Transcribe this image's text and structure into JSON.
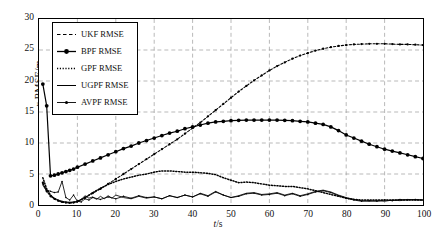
{
  "chart_data": {
    "type": "line",
    "title": "",
    "xlabel": "t/s",
    "ylabel": "x RMSE/m",
    "xlim": [
      0,
      100
    ],
    "ylim": [
      0,
      30
    ],
    "xticks": [
      0,
      10,
      20,
      30,
      40,
      50,
      60,
      70,
      80,
      90,
      100
    ],
    "yticks": [
      0,
      5,
      10,
      15,
      20,
      25,
      30
    ],
    "grid": true,
    "legend_position": "upper-left-inset",
    "series": [
      {
        "name": "UKF RMSE",
        "style": "dashed",
        "marker": "dot-dense",
        "x": [
          1,
          2,
          3,
          4,
          5,
          6,
          7,
          8,
          9,
          10,
          12,
          14,
          16,
          18,
          20,
          22,
          24,
          26,
          28,
          30,
          32,
          34,
          36,
          38,
          40,
          42,
          44,
          46,
          48,
          50,
          52,
          54,
          56,
          58,
          60,
          62,
          64,
          66,
          68,
          70,
          72,
          74,
          76,
          78,
          80,
          82,
          84,
          86,
          88,
          90,
          92,
          94,
          96,
          98,
          100
        ],
        "values": [
          3.6,
          2.2,
          1.4,
          1.0,
          0.7,
          0.5,
          0.4,
          0.35,
          0.4,
          0.6,
          1.2,
          1.9,
          2.6,
          3.4,
          4.2,
          5.0,
          5.8,
          6.6,
          7.4,
          8.2,
          9.0,
          9.8,
          10.6,
          11.5,
          12.4,
          13.3,
          14.3,
          15.3,
          16.3,
          17.3,
          18.3,
          19.2,
          20.1,
          20.9,
          21.7,
          22.4,
          23.0,
          23.6,
          24.1,
          24.5,
          24.9,
          25.2,
          25.45,
          25.65,
          25.8,
          25.9,
          25.95,
          26.0,
          26.0,
          26.0,
          25.95,
          25.9,
          25.9,
          25.85,
          25.8
        ]
      },
      {
        "name": "BPF RMSE",
        "style": "solid",
        "marker": "circle-filled",
        "x": [
          1,
          2,
          3,
          4,
          5,
          6,
          7,
          8,
          9,
          10,
          12,
          14,
          16,
          18,
          20,
          22,
          24,
          26,
          28,
          30,
          32,
          34,
          36,
          38,
          40,
          42,
          44,
          46,
          48,
          50,
          52,
          54,
          56,
          58,
          60,
          62,
          64,
          66,
          68,
          70,
          72,
          74,
          76,
          78,
          80,
          82,
          84,
          86,
          88,
          90,
          92,
          94,
          96,
          98,
          100
        ],
        "values": [
          19.5,
          16.0,
          4.7,
          4.8,
          5.0,
          5.2,
          5.4,
          5.6,
          5.8,
          6.1,
          6.6,
          7.1,
          7.6,
          8.1,
          8.6,
          9.1,
          9.5,
          10.0,
          10.4,
          10.8,
          11.2,
          11.6,
          11.9,
          12.3,
          12.6,
          12.9,
          13.2,
          13.4,
          13.5,
          13.6,
          13.65,
          13.7,
          13.7,
          13.7,
          13.7,
          13.7,
          13.65,
          13.6,
          13.5,
          13.4,
          13.2,
          13.0,
          12.6,
          12.0,
          11.3,
          10.8,
          10.3,
          9.8,
          9.4,
          9.0,
          8.7,
          8.4,
          8.1,
          7.8,
          7.5
        ]
      },
      {
        "name": "GPF RMSE",
        "style": "dotted",
        "marker": "none",
        "x": [
          1,
          2,
          3,
          4,
          5,
          6,
          7,
          8,
          9,
          10,
          12,
          14,
          16,
          18,
          20,
          22,
          24,
          26,
          28,
          30,
          32,
          34,
          36,
          38,
          40,
          42,
          44,
          46,
          48,
          50,
          52,
          54,
          56,
          58,
          60,
          62,
          64,
          66,
          68,
          70,
          72,
          74,
          76,
          78,
          80,
          82,
          84,
          86,
          88,
          90,
          92,
          94,
          96,
          98,
          100
        ],
        "values": [
          4.4,
          2.6,
          1.6,
          1.0,
          0.7,
          0.5,
          0.4,
          0.35,
          0.4,
          0.5,
          1.2,
          2.0,
          2.7,
          3.3,
          3.8,
          4.2,
          4.5,
          4.8,
          5.0,
          5.3,
          5.5,
          5.5,
          5.4,
          5.3,
          5.3,
          5.2,
          5.1,
          4.9,
          4.4,
          4.0,
          3.6,
          3.7,
          3.6,
          3.4,
          3.2,
          3.1,
          3.0,
          3.0,
          2.8,
          2.6,
          2.3,
          2.0,
          1.7,
          1.4,
          1.1,
          0.9,
          0.8,
          0.8,
          0.8,
          0.8,
          0.8,
          0.8,
          0.8,
          0.8,
          0.8
        ]
      },
      {
        "name": "UGPF RMSE",
        "style": "solid-thin",
        "marker": "none",
        "x": [
          1,
          2,
          3,
          4,
          5,
          6,
          7,
          8,
          9,
          10,
          11,
          12,
          13,
          14,
          15,
          16,
          17,
          18,
          19,
          20,
          22,
          24,
          26,
          28,
          30,
          32,
          34,
          36,
          38,
          40,
          42,
          44,
          46,
          48,
          50,
          52,
          54,
          56,
          58,
          60,
          62,
          64,
          66,
          68,
          70,
          72,
          74,
          76,
          78,
          80,
          82,
          84,
          86,
          88,
          90,
          92,
          94,
          96,
          98,
          100
        ],
        "values": [
          3.2,
          2.2,
          1.6,
          1.1,
          0.8,
          0.6,
          0.5,
          0.45,
          0.5,
          0.6,
          0.9,
          1.5,
          1.1,
          1.3,
          0.9,
          1.4,
          1.0,
          1.5,
          1.1,
          1.6,
          1.2,
          1.0,
          1.4,
          1.1,
          1.3,
          1.0,
          1.5,
          1.2,
          1.6,
          1.3,
          1.9,
          1.5,
          2.2,
          1.6,
          1.2,
          1.5,
          1.9,
          2.0,
          1.7,
          1.8,
          2.0,
          1.6,
          1.9,
          1.5,
          1.8,
          2.2,
          2.4,
          2.1,
          1.6,
          1.2,
          0.9,
          0.7,
          0.6,
          0.7,
          0.6,
          0.8,
          0.7,
          0.9,
          0.8,
          0.8
        ]
      },
      {
        "name": "AVPF RMSE",
        "style": "solid-thin",
        "marker": "dot-small",
        "x": [
          1,
          2,
          3,
          4,
          5,
          6,
          7,
          8,
          9,
          10,
          11,
          12,
          13,
          14,
          16,
          18,
          20,
          22,
          24,
          26,
          28,
          30,
          32,
          34,
          36,
          38,
          40,
          42,
          44,
          46,
          48,
          50,
          52,
          54,
          56,
          58,
          60,
          62,
          64,
          66,
          68,
          70,
          72,
          74,
          76,
          78,
          80,
          82,
          84,
          86,
          88,
          90,
          92,
          94,
          96,
          98,
          100
        ],
        "values": [
          3.4,
          2.4,
          2.2,
          2.0,
          2.1,
          3.8,
          1.2,
          0.8,
          1.6,
          0.6,
          0.5,
          1.0,
          0.8,
          1.2,
          0.9,
          1.3,
          1.0,
          1.4,
          1.1,
          1.5,
          1.2,
          1.3,
          1.0,
          1.5,
          1.2,
          1.6,
          1.3,
          1.8,
          1.4,
          2.1,
          1.6,
          1.2,
          1.4,
          1.8,
          1.9,
          1.6,
          1.7,
          1.9,
          1.5,
          1.8,
          1.4,
          1.7,
          2.1,
          2.3,
          2.0,
          1.5,
          1.1,
          0.8,
          0.6,
          0.7,
          0.6,
          0.8,
          0.7,
          0.9,
          0.8,
          0.9,
          0.8
        ]
      }
    ]
  },
  "legend": {
    "items": [
      {
        "label": "UKF RMSE"
      },
      {
        "label": "BPF RMSE"
      },
      {
        "label": "GPF RMSE"
      },
      {
        "label": "UGPF RMSE"
      },
      {
        "label": "AVPF RMSE"
      }
    ]
  },
  "axes": {
    "ylabel_prefix": "x",
    "ylabel_rest": " RMSE/m",
    "xlabel_prefix": "t",
    "xlabel_rest": "/s"
  },
  "colors": {
    "line": "#000000",
    "grid": "#999999",
    "frame": "#000000",
    "background": "#ffffff"
  }
}
